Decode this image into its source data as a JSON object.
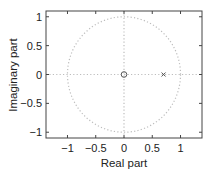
{
  "chart_data": {
    "type": "scatter",
    "title": "",
    "xlabel": "Real part",
    "ylabel": "Imaginary part",
    "xlim": [
      -1.38,
      1.38
    ],
    "ylim": [
      -1.1,
      1.1
    ],
    "xticks": [
      -1,
      -0.5,
      0,
      0.5,
      1
    ],
    "xtick_labels": [
      "−1",
      "−0.5",
      "0",
      "0.5",
      "1"
    ],
    "yticks": [
      1,
      0.5,
      0,
      -0.5,
      -1
    ],
    "ytick_labels": [
      "1",
      "0.5",
      "0",
      "−0.5",
      "−1"
    ],
    "grid": false,
    "unit_circle": {
      "center": [
        0,
        0
      ],
      "radius": 1,
      "style": "dotted"
    },
    "axes_lines": {
      "style": "dotted"
    },
    "series": [
      {
        "name": "zeros",
        "marker": "o",
        "points": [
          [
            0,
            0
          ]
        ]
      },
      {
        "name": "poles",
        "marker": "x",
        "points": [
          [
            0.7,
            0
          ]
        ]
      }
    ],
    "colors": {
      "axes": "#444444",
      "guides": "#bdbdbd",
      "markers": "#555555"
    }
  }
}
